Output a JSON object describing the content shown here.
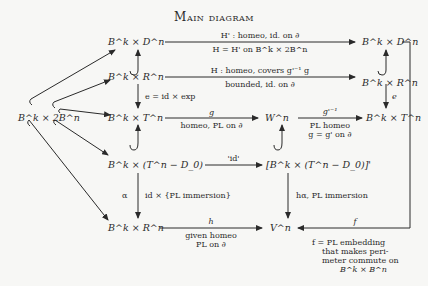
{
  "title": "Main diagram",
  "nodes": {
    "bk_dn_left": "B^k × D^n",
    "bk_dn_right": "B^k × D^n",
    "bk_rn_left": "B^k × R^n",
    "bk_rn_right": "B^k × R^n",
    "bk_2bn": "B^k × 2B^n",
    "bk_tn_left": "B^k × T^n",
    "wn": "W^n",
    "bk_tn_right": "B^k × T^n",
    "bk_tn_minus_d0": "B^k × (T^n − D_0)",
    "bk_tn_minus_d0_prime": "[B^k × (T^n − D_0)]'",
    "bk_rn_bottom": "B^k × R^n",
    "vn": "V^n"
  },
  "arrows": {
    "top_above": "H' : homeo, id. on ∂",
    "top_below": "H = H'  on  B^k × 2B^n",
    "second_above": "H : homeo, covers g'⁻¹ g",
    "second_below": "bounded, id. on ∂",
    "left_vertical_e": "e = id × exp",
    "right_vertical_e": "e",
    "g_above": "g",
    "g_below": "homeo,  PL  on  ∂",
    "ginv_above": "g'⁻¹",
    "ginv_below1": "PL  homeo",
    "ginv_below2": "g = g'  on  ∂",
    "id_quote": "'id'",
    "alpha": "α",
    "id_pl_immersion": "id × {PL  immersion}",
    "h_alpha": "hα,  PL  immersion",
    "h_above": "h",
    "h_below1": "given homeo",
    "h_below2": "PL  on  ∂",
    "f_above": "f",
    "f_note1": "f = PL  embedding",
    "f_note2": "that makes peri-",
    "f_note3": "meter commute on",
    "f_note4": "B^k × B^n"
  }
}
